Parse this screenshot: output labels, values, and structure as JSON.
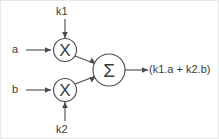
{
  "diagram": {
    "colors": {
      "line": "#4a4a4a",
      "text": "#3a3a3a",
      "background": "#ffffff",
      "border": "#e8e8e8"
    },
    "inputs": [
      {
        "id": "a",
        "label": "a"
      },
      {
        "id": "b",
        "label": "b"
      },
      {
        "id": "k1",
        "label": "k1"
      },
      {
        "id": "k2",
        "label": "k2"
      }
    ],
    "blocks": [
      {
        "id": "mult-top",
        "glyph": "X",
        "name": "multiplier-top"
      },
      {
        "id": "mult-bottom",
        "glyph": "X",
        "name": "multiplier-bottom"
      },
      {
        "id": "summer",
        "glyph": "Σ",
        "name": "summing-junction"
      }
    ],
    "output": {
      "label": "(k1.a + k2.b)"
    }
  }
}
